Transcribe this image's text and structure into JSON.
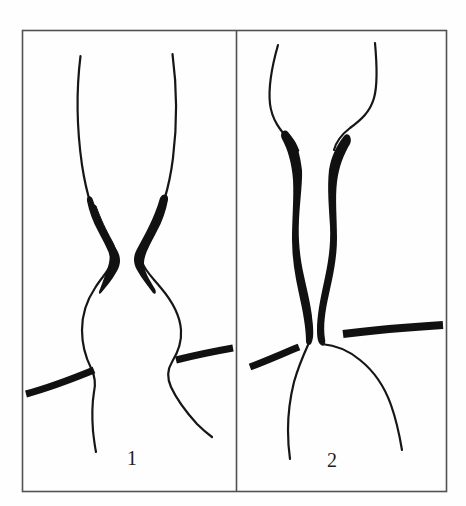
{
  "figure": {
    "background_color": "#fefefe",
    "ink_color": "#111111",
    "border_color": "#4a4a4a",
    "frame": {
      "x": 22,
      "y": 30,
      "width": 425,
      "height": 462
    },
    "divider_x": 236,
    "panels": [
      {
        "id": "panel-1",
        "label": "1",
        "label_x": 127,
        "label_y": 448,
        "description": "Line drawing of a narrowed tubular structure with two dark tapered wedge-shaped densities meeting at a central waist, widening into a rounded bulb below; two thick marker strokes point at the lower constriction from left and right.",
        "pointers": [
          {
            "name": "left-pointer",
            "x1": 26,
            "y1": 394,
            "x2": 94,
            "y2": 370,
            "thickness": 7
          },
          {
            "name": "right-pointer",
            "x1": 176,
            "y1": 360,
            "x2": 233,
            "y2": 348,
            "thickness": 7
          }
        ]
      },
      {
        "id": "panel-2",
        "label": "2",
        "label_x": 327,
        "label_y": 450,
        "description": "Line drawing of a tubular structure with two long sinuous thick black bands running the full vertical length separated by a thin lumen, flaring open at the top and ending in a widened rounded base below; two thick marker strokes point at the lower end from left and right.",
        "pointers": [
          {
            "name": "left-pointer",
            "x1": 250,
            "y1": 367,
            "x2": 299,
            "y2": 347,
            "thickness": 7
          },
          {
            "name": "right-pointer",
            "x1": 343,
            "y1": 334,
            "x2": 443,
            "y2": 325,
            "thickness": 8
          }
        ]
      }
    ]
  }
}
